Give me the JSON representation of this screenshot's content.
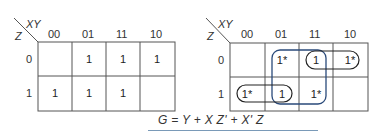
{
  "maps": [
    {
      "id": "left",
      "row_var": "Z",
      "col_var": "XY",
      "col_labels": [
        "00",
        "01",
        "11",
        "10"
      ],
      "row_labels": [
        "0",
        "1"
      ],
      "cells": [
        [
          "",
          "1",
          "1",
          "1"
        ],
        [
          "1",
          "1",
          "1",
          ""
        ]
      ]
    },
    {
      "id": "right",
      "row_var": "Z",
      "col_var": "XY",
      "col_labels": [
        "00",
        "01",
        "11",
        "10"
      ],
      "row_labels": [
        "0",
        "1"
      ],
      "cells": [
        [
          "",
          "1*",
          "1",
          "1*"
        ],
        [
          "1*",
          "1",
          "1*",
          ""
        ]
      ],
      "groupings": [
        {
          "name": "Y",
          "cells": "cols 01-11, rows 0-1",
          "color": "#2a4a7a"
        },
        {
          "name": "XZ'",
          "cells": "row 0, cols 11-10",
          "color": "#222222"
        },
        {
          "name": "X'Z",
          "cells": "row 1, cols 00-01",
          "color": "#222222"
        }
      ]
    }
  ],
  "equation": "G = Y + X Z' + X' Z",
  "colors": {
    "grid": "#555555",
    "loop_big": "#2a4a7a",
    "loop_small": "#222222",
    "underline": "#7a9ab8"
  }
}
